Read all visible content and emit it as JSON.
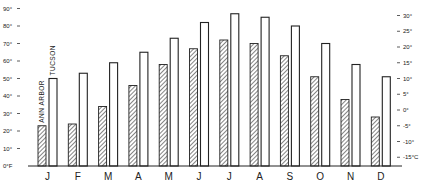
{
  "chart_data": {
    "type": "bar",
    "title": "",
    "xlabel": "",
    "ylabel": "",
    "categories": [
      "J",
      "F",
      "M",
      "A",
      "M",
      "J",
      "J",
      "A",
      "S",
      "O",
      "N",
      "D"
    ],
    "series": [
      {
        "name": "ANN ARBOR",
        "style": "hatched",
        "values": [
          23,
          24,
          34,
          46,
          58,
          67,
          72,
          70,
          63,
          51,
          38,
          28
        ]
      },
      {
        "name": "TUCSON",
        "style": "open",
        "values": [
          50,
          53,
          59,
          65,
          73,
          82,
          87,
          85,
          80,
          70,
          58,
          51
        ]
      }
    ],
    "ylim": [
      0,
      90
    ],
    "y_ticks_left": [
      "0°F",
      "10°",
      "20°",
      "30°",
      "40°",
      "50°",
      "60°",
      "70°",
      "80°",
      "90°"
    ],
    "y_tick_values_left": [
      0,
      10,
      20,
      30,
      40,
      50,
      60,
      70,
      80,
      90
    ],
    "y_ticks_right": [
      "-15°C",
      "-10°",
      "-5°",
      "0°",
      "5°",
      "10°",
      "15°",
      "20°",
      "25°",
      "30°"
    ],
    "y_tick_values_right_c": [
      -15,
      -10,
      -5,
      0,
      5,
      10,
      15,
      20,
      25,
      30
    ],
    "grid": false,
    "legend_position": "inline-vertical-labels-above-first-bars",
    "units_left": "°F",
    "units_right": "°C"
  }
}
